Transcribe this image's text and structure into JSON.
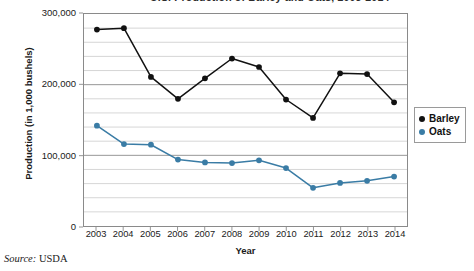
{
  "chart_data": {
    "type": "line",
    "title": "U.S. Production of Barley and Oats, 2003-2014",
    "xlabel": "Year",
    "ylabel": "Production (in 1,000 bushels)",
    "categories": [
      "2003",
      "2004",
      "2005",
      "2006",
      "2007",
      "2008",
      "2009",
      "2010",
      "2011",
      "2012",
      "2013",
      "2014"
    ],
    "x": [
      2003,
      2004,
      2005,
      2006,
      2007,
      2008,
      2009,
      2010,
      2011,
      2012,
      2013,
      2014
    ],
    "series": [
      {
        "name": "Barley",
        "color": "#111111",
        "values": [
          278000,
          280000,
          211000,
          180000,
          209000,
          237000,
          225000,
          179000,
          153000,
          216000,
          215000,
          175000
        ]
      },
      {
        "name": "Oats",
        "color": "#3a7ca5",
        "values": [
          142000,
          116000,
          115000,
          94000,
          90000,
          89000,
          93000,
          82000,
          54000,
          61000,
          64000,
          70000
        ]
      }
    ],
    "ylim": [
      0,
      300000
    ],
    "ytick_labels": [
      "0",
      "100,000",
      "200,000",
      "300,000"
    ],
    "ytick_values": [
      0,
      100000,
      200000,
      300000
    ],
    "yminor_step": 20000,
    "grid": "horizontal",
    "legend_position": "right",
    "source_label": "Source:",
    "source_value": "USDA"
  }
}
